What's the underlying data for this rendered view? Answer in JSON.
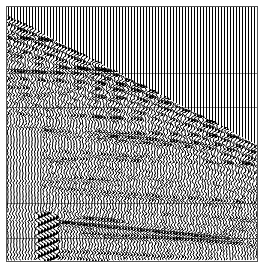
{
  "chart_data": {
    "type": "seismic-wiggle",
    "title": "",
    "xlabel": "",
    "ylabel": "",
    "trace_count": 84,
    "trace_spacing_px": 3,
    "plot_box": {
      "left": 6,
      "top": 6,
      "width": 252,
      "height": 256
    },
    "first_break": {
      "description": "linear moveout of first arrivals; blank (pre-arrival) region in upper right",
      "start": {
        "trace": 0,
        "y_px": 16
      },
      "end": {
        "trace": 83,
        "y_px": 145
      }
    },
    "horizontal_gridlines_y_px": [
      73,
      107,
      203,
      238
    ],
    "grid": true,
    "colors": {
      "trace": "#000000",
      "background": "#ffffff",
      "frame": "#555555",
      "gridline": "#888888"
    },
    "features": [
      "dense high-amplitude arrivals just below first break",
      "ground-roll / surface-wave cone near traces 10-16 at bottom",
      "lower-left traces mostly low-amplitude near-offset",
      "right half mostly dense reflections"
    ]
  }
}
